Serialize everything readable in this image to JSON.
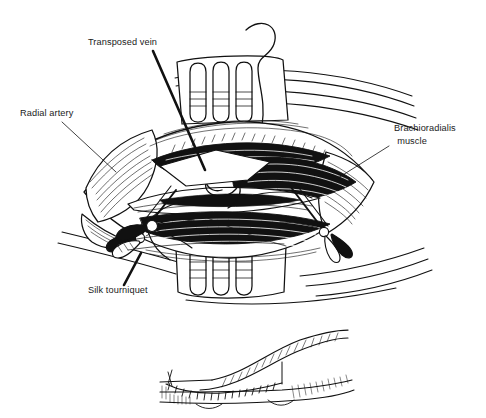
{
  "figure": {
    "kind": "medical-line-illustration",
    "background_color": "#ffffff",
    "ink_color": "#111111",
    "width": 486,
    "height": 418
  },
  "labels": {
    "transposed_vein": "Transposed vein",
    "radial_artery": "Radial artery",
    "brachioradialis_line1": "Brachioradialis",
    "brachioradialis_line2": "muscle",
    "silk_tourniquet": "Silk tourniquet"
  },
  "label_positions": {
    "transposed_vein": {
      "x": 88,
      "y": 45,
      "anchor": "start"
    },
    "radial_artery": {
      "x": 20,
      "y": 116,
      "anchor": "start"
    },
    "brachioradialis": {
      "x": 394,
      "y": 131,
      "anchor": "start"
    },
    "silk_tourniquet": {
      "x": 88,
      "y": 293,
      "anchor": "start"
    }
  },
  "leader_lines": [
    {
      "name": "transposed-vein-leader",
      "x1": 153,
      "y1": 51,
      "x2": 205,
      "y2": 170,
      "weight": 2.6
    },
    {
      "name": "radial-artery-leader",
      "x1": 62,
      "y1": 122,
      "x2": 116,
      "y2": 172,
      "weight": 0.8
    },
    {
      "name": "brachioradialis-leader",
      "x1": 389,
      "y1": 146,
      "x2": 338,
      "y2": 178,
      "weight": 0.8
    },
    {
      "name": "silk-tourniquet-leader",
      "x1": 124,
      "y1": 285,
      "x2": 141,
      "y2": 253,
      "weight": 2.6
    }
  ],
  "scene_parts": [
    {
      "name": "arm-skin-contour-upper",
      "description": "sweeping skin contour lines across upper arm"
    },
    {
      "name": "arm-skin-contour-lower",
      "description": "sweeping skin contour lines across lower arm"
    },
    {
      "name": "retractor-top",
      "description": "self-retaining retractor, three finger loops, upper wound edge"
    },
    {
      "name": "retractor-bottom",
      "description": "self-retaining retractor, three finger loops, lower wound edge"
    },
    {
      "name": "skin-flap-left",
      "description": "reflected skin/fascia flap at left of incision"
    },
    {
      "name": "skin-flap-right",
      "description": "reflected skin/fascia flap at right of incision"
    },
    {
      "name": "wound-bed",
      "description": "open diamond-shaped surgical field with cross-hatched tissue"
    },
    {
      "name": "radial-artery-vessel",
      "description": "artery running along floor of wound"
    },
    {
      "name": "transposed-vein-vessel",
      "description": "mobilised vein looped over into the field"
    },
    {
      "name": "suture-wire",
      "description": "curved suture strand rising out of the top of the wound"
    },
    {
      "name": "hemostat-left",
      "description": "hemostat clamp, ring handles, lower left"
    },
    {
      "name": "hemostat-right",
      "description": "hemostat clamp, ring handles, lower right"
    },
    {
      "name": "silk-tourniquet-knot",
      "description": "silk tie looped around vessel, lower left"
    },
    {
      "name": "inset-anastomosis",
      "description": "detail inset: completed end-to-side anastomosis with running suture line"
    }
  ]
}
